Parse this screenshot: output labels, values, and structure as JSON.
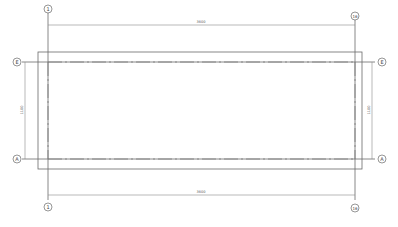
{
  "drawing": {
    "type": "architectural floor plan grid",
    "grid_lines_vertical": [
      {
        "label": "1",
        "x": 48
      },
      {
        "label": "16",
        "x": 355
      }
    ],
    "grid_lines_horizontal": [
      {
        "label": "E",
        "y": 62
      },
      {
        "label": "A",
        "y": 159
      }
    ],
    "dimensions": {
      "top": "3600",
      "bottom": "3600",
      "left": "1100",
      "right": "1100"
    },
    "colors": {
      "line": "#6a6a6a",
      "background": "#ffffff"
    }
  }
}
